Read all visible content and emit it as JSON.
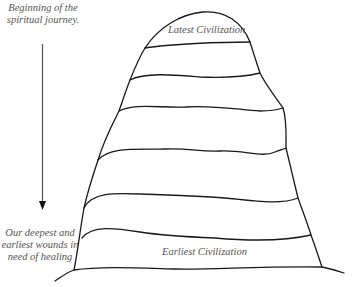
{
  "diagram": {
    "top_note": {
      "line1": "Beginning of the",
      "line2": "spiritual journey."
    },
    "bottom_note": {
      "line1": "Our deepest and",
      "line2": "earliest wounds in",
      "line3": "need of healing"
    },
    "layers": {
      "top_label": "Latest Civilization",
      "bottom_label": "Earliest Civilization",
      "band_count": 6
    },
    "arrow": {
      "direction": "down"
    },
    "colors": {
      "stroke": "#1a1a1a",
      "text": "#555555",
      "background": "#ffffff"
    }
  }
}
